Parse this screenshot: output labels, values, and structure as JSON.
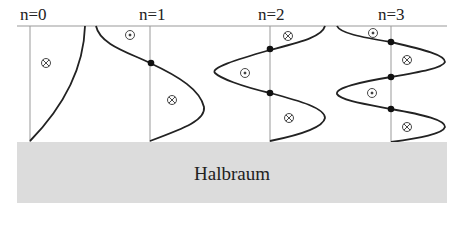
{
  "modes": [
    {
      "label": "n=0",
      "nodes": 0,
      "symbols": [
        "into-page"
      ]
    },
    {
      "label": "n=1",
      "nodes": 1,
      "symbols": [
        "out-of-page",
        "into-page"
      ]
    },
    {
      "label": "n=2",
      "nodes": 2,
      "symbols": [
        "into-page",
        "out-of-page",
        "into-page"
      ]
    },
    {
      "label": "n=3",
      "nodes": 3,
      "symbols": [
        "out-of-page",
        "into-page",
        "out-of-page",
        "into-page"
      ]
    }
  ],
  "halfspace": {
    "label": "Halbraum",
    "color": "#dcdcdc"
  },
  "symbols": {
    "into_page": "⊗",
    "out_of_page": "⊙"
  }
}
